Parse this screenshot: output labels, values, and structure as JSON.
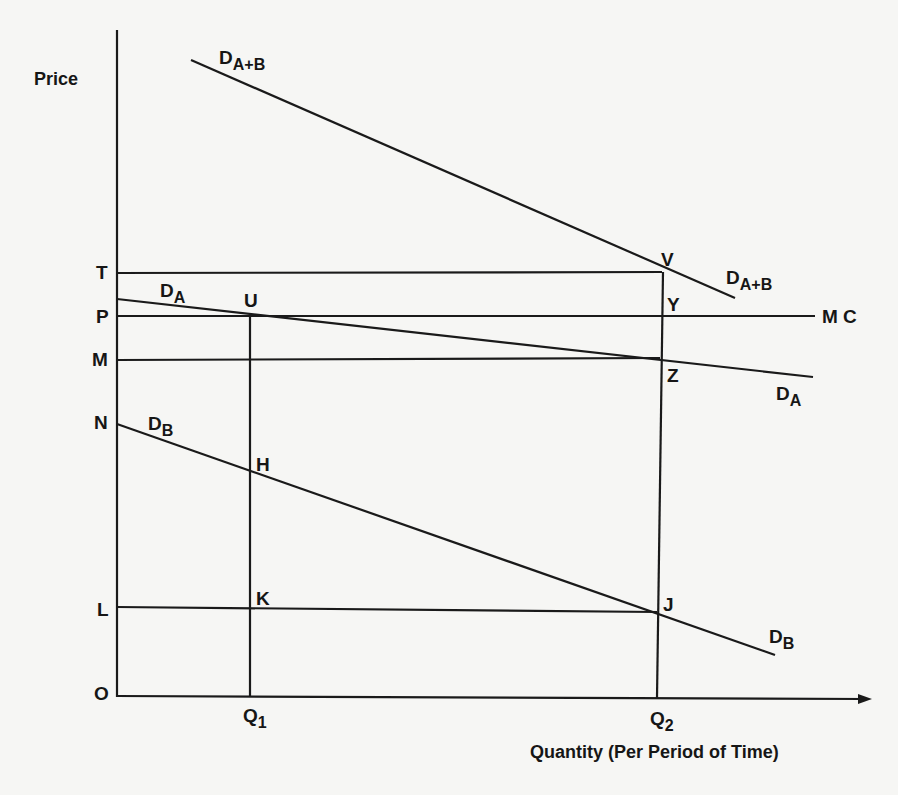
{
  "diagram": {
    "y_axis_label": "Price",
    "x_axis_label": "Quantity (Per Period of Time)",
    "origin_label": "O",
    "price_levels": [
      {
        "name": "T",
        "y": 273
      },
      {
        "name": "P",
        "y": 316
      },
      {
        "name": "M",
        "y": 360
      },
      {
        "name": "N",
        "y": 424
      },
      {
        "name": "L",
        "y": 608
      }
    ],
    "quantity_levels": [
      {
        "name": "Q",
        "sub": "1",
        "x": 250
      },
      {
        "name": "Q",
        "sub": "2",
        "x": 657
      }
    ],
    "curves": [
      {
        "id": "D_A+B",
        "label_main": "D",
        "label_sub": "A+B",
        "from": [
          191,
          60
        ],
        "to": [
          735,
          298
        ]
      },
      {
        "id": "D_A",
        "label_main": "D",
        "label_sub": "A",
        "from": [
          117,
          299
        ],
        "to": [
          813,
          377
        ]
      },
      {
        "id": "D_B",
        "label_main": "D",
        "label_sub": "B",
        "from": [
          117,
          424
        ],
        "to": [
          775,
          655
        ]
      },
      {
        "id": "MC",
        "label_main": "M C",
        "from": [
          117,
          316
        ],
        "to": [
          815,
          316
        ]
      }
    ],
    "points": [
      {
        "name": "U",
        "x": 250,
        "y": 316
      },
      {
        "name": "V",
        "x": 660,
        "y": 273
      },
      {
        "name": "Y",
        "x": 660,
        "y": 316
      },
      {
        "name": "Z",
        "x": 660,
        "y": 358
      },
      {
        "name": "H",
        "x": 250,
        "y": 470
      },
      {
        "name": "K",
        "x": 250,
        "y": 608
      },
      {
        "name": "J",
        "x": 657,
        "y": 612
      }
    ],
    "labels": {
      "price": "Price",
      "quantity": "Quantity (Per Period of Time)",
      "O": "O",
      "T": "T",
      "P": "P",
      "M": "M",
      "N": "N",
      "L": "L",
      "Q": "Q",
      "sub1": "1",
      "sub2": "2",
      "D": "D",
      "subAB": "A+B",
      "subA": "A",
      "subB": "B",
      "MC": "M C",
      "U": "U",
      "V": "V",
      "Y": "Y",
      "Z": "Z",
      "H": "H",
      "K": "K",
      "J": "J"
    },
    "line_color": "#1a1a1a",
    "background_color": "#f6f6f4"
  }
}
